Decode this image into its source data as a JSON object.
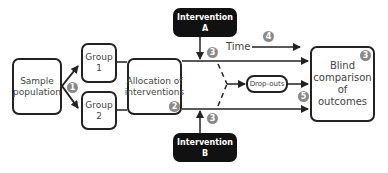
{
  "diagram": {
    "nodes": {
      "sample": {
        "line1": "Sample",
        "line2": "population"
      },
      "group1": {
        "line1": "Group",
        "line2": "1"
      },
      "group2": {
        "line1": "Group",
        "line2": "2"
      },
      "allocation": {
        "line1": "Allocation of",
        "line2": "interventions"
      },
      "intervention_a": {
        "line1": "Intervention",
        "line2": "A"
      },
      "intervention_b": {
        "line1": "Intervention",
        "line2": "B"
      },
      "dropouts": {
        "label": "Drop-outs"
      },
      "outcome": {
        "line1": "Blind",
        "line2": "comparison",
        "line3": "of",
        "line4": "outcomes"
      }
    },
    "time_label": "Time",
    "badges": {
      "b1": "1",
      "b2": "2",
      "b3a": "3",
      "b3b": "3",
      "b3c": "3",
      "b4": "4",
      "b5": "5"
    },
    "colors": {
      "line": "#222222",
      "dark_box": "#111111",
      "badge": "#8a8a8a"
    }
  }
}
